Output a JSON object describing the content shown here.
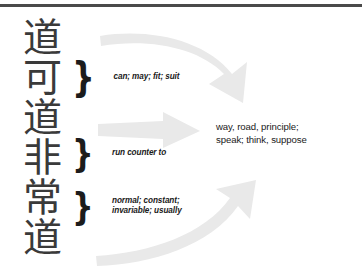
{
  "diagram": {
    "title_rule_color": "#4a4a4a",
    "arrow_color": "#e9e9e9",
    "source_text": {
      "characters": [
        {
          "glyph": "道",
          "pinyin_order": 1
        },
        {
          "glyph": "可",
          "pinyin_order": 2
        },
        {
          "glyph": "道",
          "pinyin_order": 3
        },
        {
          "glyph": "非",
          "pinyin_order": 4
        },
        {
          "glyph": "常",
          "pinyin_order": 5
        },
        {
          "glyph": "道",
          "pinyin_order": 6
        }
      ]
    },
    "glosses": [
      {
        "brace": "}",
        "text": "can; may; fit; suit"
      },
      {
        "brace": "}",
        "text": "run counter to"
      },
      {
        "brace": "}",
        "text": "normal; constant;\ninvariable; usually"
      }
    ],
    "translation": "way, road, principle;\nspeak; think, suppose"
  }
}
